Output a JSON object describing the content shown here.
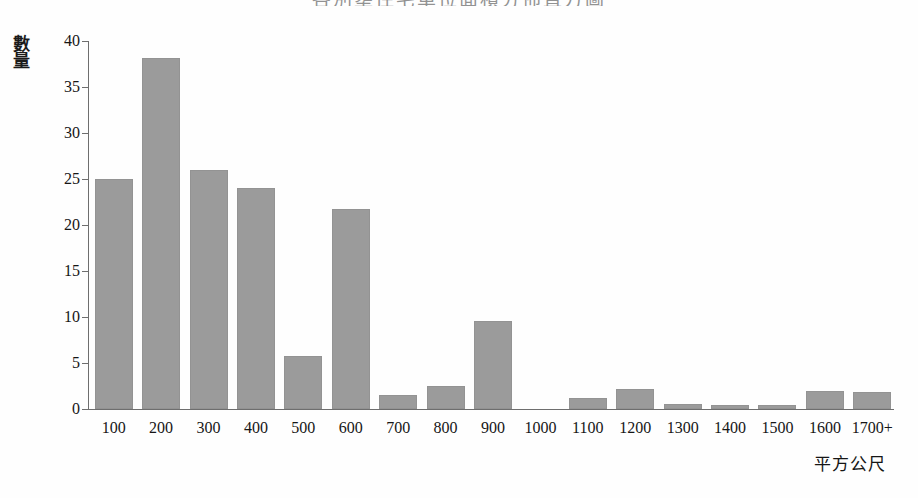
{
  "chart_data": {
    "type": "bar",
    "title": "各別壅住宅單位面積分佈直方圖",
    "xlabel": "平方公尺",
    "ylabel": "數量",
    "categories": [
      "100",
      "200",
      "300",
      "400",
      "500",
      "600",
      "700",
      "800",
      "900",
      "1000",
      "1100",
      "1200",
      "1300",
      "1400",
      "1500",
      "1600",
      "1700+"
    ],
    "values": [
      25.0,
      38.2,
      26.0,
      24.0,
      5.8,
      21.7,
      1.5,
      2.5,
      9.6,
      0,
      1.2,
      2.2,
      0.5,
      0.4,
      0.4,
      2.0,
      1.9
    ],
    "ylim": [
      0,
      40
    ],
    "yticks": [
      0,
      5,
      10,
      15,
      20,
      25,
      30,
      35,
      40
    ],
    "grid": false,
    "legend": false,
    "bar_color": "#9b9b9b",
    "axis_color": "#6e6e6e"
  },
  "axis": {
    "y_title_chars": [
      "數",
      "量"
    ]
  }
}
